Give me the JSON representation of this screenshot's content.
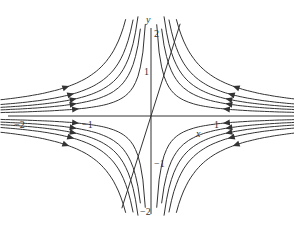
{
  "chart_data": {
    "type": "line",
    "title": "",
    "xlabel": "x",
    "ylabel": "y",
    "xlim": [
      -2.1,
      2.2
    ],
    "ylim": [
      -2.1,
      2.2
    ],
    "x_ticks": [
      {
        "v": -2,
        "label": "−2"
      },
      {
        "v": -1,
        "label": "−1"
      },
      {
        "v": 1,
        "label": "1"
      }
    ],
    "y_ticks": [
      {
        "v": 2,
        "label": "2"
      },
      {
        "v": 1,
        "label": "1"
      },
      {
        "v": -1,
        "label": "−1"
      },
      {
        "v": -2,
        "label": "−2"
      }
    ],
    "line_through_origin_slope": 4.5,
    "colors": {
      "curve": "#333333",
      "axis": "#333333"
    }
  }
}
